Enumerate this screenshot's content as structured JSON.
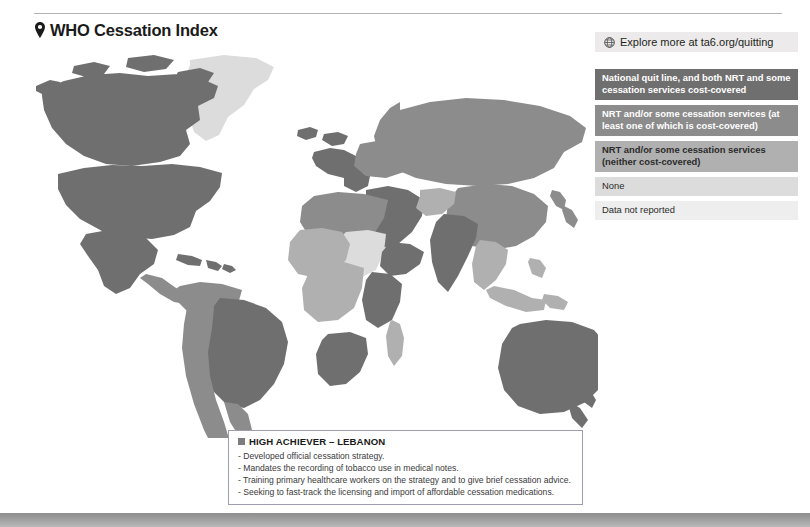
{
  "header": {
    "title": "WHO Cessation Index",
    "pin_icon": "location-pin-icon"
  },
  "explore": {
    "label": "Explore more at ta6.org/quitting",
    "icon": "globe-icon"
  },
  "legend": {
    "items": [
      {
        "label": "National quit line, and both NRT and some cessation services cost-covered",
        "color": "#6f6f6f",
        "text_color": "#ffffff"
      },
      {
        "label": "NRT and/or some cessation services (at least one of which is cost-covered)",
        "color": "#8c8c8c",
        "text_color": "#ffffff"
      },
      {
        "label": "NRT and/or some cessation services (neither cost-covered)",
        "color": "#b0b0b0",
        "text_color": "#2b2b2b"
      },
      {
        "label": "None",
        "color": "#dcdcdc",
        "text_color": "#2b2b2b"
      },
      {
        "label": "Data not reported",
        "color": "#eeeeee",
        "text_color": "#2b2b2b"
      }
    ]
  },
  "caption": {
    "badge_icon": "square-bullet-icon",
    "title": "HIGH ACHIEVER – LEBANON",
    "lines": [
      "- Developed official cessation strategy.",
      "- Mandates the recording of tobacco use in medical notes.",
      "- Training primary healthcare workers on the strategy and to give brief cessation advice.",
      "- Seeking to fast-track the licensing and import of affordable cessation medications."
    ]
  },
  "map": {
    "ocean_color": "#ffffff",
    "regions": [
      {
        "name": "greenland",
        "category": 4
      },
      {
        "name": "canada",
        "category": 0
      },
      {
        "name": "united-states",
        "category": 0
      },
      {
        "name": "mexico",
        "category": 0
      },
      {
        "name": "central-america",
        "category": 1
      },
      {
        "name": "caribbean",
        "category": 0
      },
      {
        "name": "brazil",
        "category": 0
      },
      {
        "name": "northern-south-america",
        "category": 1
      },
      {
        "name": "southern-south-america",
        "category": 1
      },
      {
        "name": "western-europe",
        "category": 0
      },
      {
        "name": "eastern-europe",
        "category": 1
      },
      {
        "name": "russia",
        "category": 1
      },
      {
        "name": "north-africa",
        "category": 1
      },
      {
        "name": "sahel",
        "category": 2
      },
      {
        "name": "west-africa",
        "category": 2
      },
      {
        "name": "horn-of-africa",
        "category": 0
      },
      {
        "name": "east-africa",
        "category": 0
      },
      {
        "name": "central-africa",
        "category": 2
      },
      {
        "name": "southern-africa",
        "category": 0
      },
      {
        "name": "madagascar",
        "category": 2
      },
      {
        "name": "middle-east",
        "category": 0
      },
      {
        "name": "india",
        "category": 0
      },
      {
        "name": "china",
        "category": 1
      },
      {
        "name": "southeast-asia",
        "category": 2
      },
      {
        "name": "indonesia",
        "category": 2
      },
      {
        "name": "australia",
        "category": 0
      },
      {
        "name": "new-zealand",
        "category": 0
      }
    ]
  }
}
